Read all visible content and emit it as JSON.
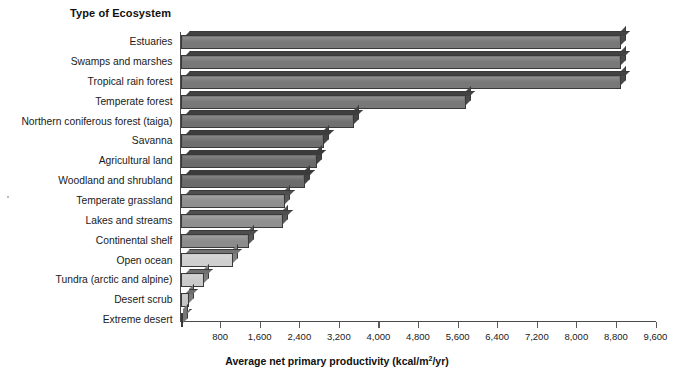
{
  "chart_data": {
    "type": "bar",
    "orientation": "horizontal",
    "title": "",
    "category_axis_title": "Type of Ecosystem",
    "xlabel": "Average net primary productivity (kcal/m²/yr)",
    "ylabel": "",
    "xlim": [
      0,
      9600
    ],
    "xtick_step": 800,
    "grid": false,
    "legend": null,
    "xticks": [
      "800",
      "1,600",
      "2,400",
      "3,200",
      "4,000",
      "4,800",
      "5,600",
      "6,400",
      "7,200",
      "8,000",
      "8,800",
      "9,600"
    ],
    "xtick_values": [
      800,
      1600,
      2400,
      3200,
      4000,
      4800,
      5600,
      6400,
      7200,
      8000,
      8800,
      9600
    ],
    "categories": [
      "Estuaries",
      "Swamps and marshes",
      "Tropical rain forest",
      "Temperate forest",
      "Northern coniferous forest (taiga)",
      "Savanna",
      "Agricultural land",
      "Woodland and shrubland",
      "Temperate grassland",
      "Lakes and streams",
      "Continental shelf",
      "Open ocean",
      "Tundra (arctic and alpine)",
      "Desert scrub",
      "Extreme desert"
    ],
    "values": [
      8900,
      8900,
      8900,
      5760,
      3500,
      2900,
      2750,
      2525,
      2120,
      2080,
      1375,
      1050,
      465,
      170,
      40
    ],
    "bar_colors": [
      "#787878",
      "#787878",
      "#787878",
      "#787878",
      "#707070",
      "#6e6e6e",
      "#6b6b6b",
      "#6b6b6b",
      "#8f8f8f",
      "#8f8f8f",
      "#8c8c8c",
      "#cfcfcf",
      "#cacaca",
      "#c6c6c6",
      "#c2c2c2"
    ],
    "axis_color": "#4a4a4a"
  }
}
